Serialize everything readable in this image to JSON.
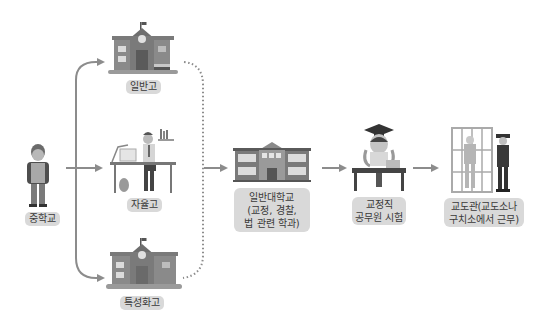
{
  "diagram": {
    "nodes": {
      "middle_school": {
        "label": "중학교",
        "icon": "student-with-backpack-icon"
      },
      "general_high": {
        "label": "일반고",
        "icon": "school-building-icon"
      },
      "autonomous_high": {
        "label": "자율고",
        "icon": "student-at-desk-icon"
      },
      "specialized_high": {
        "label": "특성화고",
        "icon": "school-building-icon"
      },
      "university": {
        "label": "일반대학교\n(교정, 경찰,\n법 관련 학과)",
        "icon": "university-building-icon"
      },
      "exam": {
        "label": "교정직\n공무원 시험",
        "icon": "graduate-studying-icon"
      },
      "job": {
        "label": "교도관(교도소나\n구치소에서 근무)",
        "icon": "prison-guard-icon"
      }
    },
    "edges": [
      {
        "from": "middle_school",
        "to": "general_high",
        "style": "solid"
      },
      {
        "from": "middle_school",
        "to": "autonomous_high",
        "style": "solid"
      },
      {
        "from": "middle_school",
        "to": "specialized_high",
        "style": "solid"
      },
      {
        "from": "general_high",
        "to": "university",
        "style": "dotted"
      },
      {
        "from": "autonomous_high",
        "to": "university",
        "style": "dotted"
      },
      {
        "from": "specialized_high",
        "to": "university",
        "style": "dotted"
      },
      {
        "from": "university",
        "to": "exam",
        "style": "solid"
      },
      {
        "from": "exam",
        "to": "job",
        "style": "solid"
      }
    ],
    "colors": {
      "arrow": "#8c8c8c",
      "label_bg": "#d9d9d9",
      "text": "#3a3a3a"
    }
  }
}
